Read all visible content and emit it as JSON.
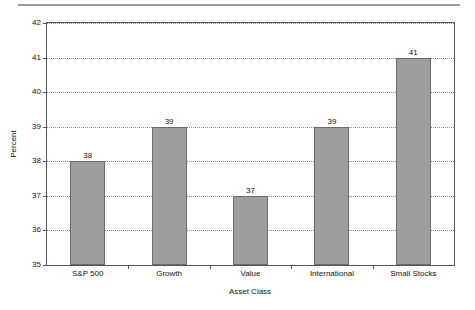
{
  "chart_data": {
    "type": "bar",
    "title": "",
    "xlabel": "Asset Class",
    "ylabel": "Percent",
    "categories": [
      "S&P 500",
      "Growth",
      "Value",
      "International",
      "Small Stocks"
    ],
    "values": [
      38,
      39,
      37,
      39,
      41
    ],
    "value_labels": [
      "38",
      "39",
      "37",
      "39",
      "41"
    ],
    "ylim": [
      35,
      42
    ],
    "yticks": [
      35,
      36,
      37,
      38,
      39,
      40,
      41,
      42
    ],
    "ytick_labels": [
      "35",
      "36",
      "37",
      "38",
      "39",
      "40",
      "41",
      "42"
    ],
    "grid": "horizontal-dotted",
    "legend": "none",
    "bar_color": "#9e9e9e",
    "bar_border_color": "#6b6b6b",
    "axis_color": "#555555",
    "grid_color": "#8c8c8c",
    "background": "#ffffff"
  },
  "decor": {
    "top_rule_color": "#9a9a9a"
  }
}
